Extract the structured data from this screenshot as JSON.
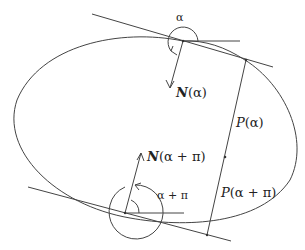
{
  "diagram": {
    "labels": {
      "alpha": "α",
      "alpha_plus_pi": "α + π",
      "normal_alpha_symbol": "N",
      "normal_alpha_arg": "(α)",
      "normal_alpha_pi_symbol": "N",
      "normal_alpha_pi_arg": "(α + π)",
      "p_alpha_symbol": "P",
      "p_alpha_arg": "(α)",
      "p_alpha_pi_symbol": "P",
      "p_alpha_pi_arg": "(α + π)"
    },
    "colors": {
      "stroke": "#333333",
      "background": "#ffffff"
    }
  }
}
